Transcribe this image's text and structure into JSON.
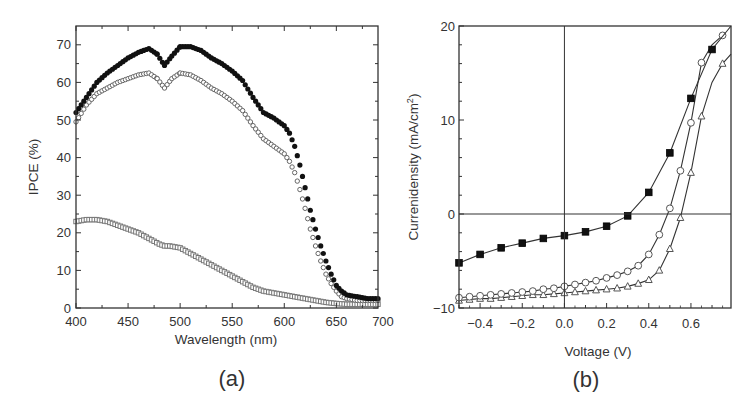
{
  "chart_data": [
    {
      "panel": "a",
      "type": "scatter",
      "caption": "(a)",
      "title": "",
      "xlabel": "Wavelength (nm)",
      "ylabel": "IPCE (%)",
      "xlim": [
        400,
        690
      ],
      "ylim": [
        0,
        75
      ],
      "xticks": [
        400,
        450,
        500,
        550,
        600,
        650,
        700
      ],
      "yticks": [
        0,
        10,
        20,
        30,
        40,
        50,
        60,
        70
      ],
      "grid": false,
      "legend": null,
      "series": [
        {
          "name": "filled circles",
          "marker": "filled-circle",
          "color": "#111111",
          "x": [
            400,
            410,
            420,
            430,
            440,
            450,
            460,
            470,
            478,
            485,
            492,
            500,
            510,
            520,
            530,
            540,
            550,
            560,
            570,
            580,
            590,
            600,
            605,
            610,
            615,
            620,
            625,
            630,
            635,
            640,
            645,
            650,
            655,
            660,
            670,
            680,
            690
          ],
          "y": [
            52,
            56,
            60,
            62.5,
            64.5,
            66.5,
            68,
            69,
            67.5,
            64.5,
            67,
            69.5,
            69.5,
            68.5,
            66.5,
            65,
            63,
            60.5,
            56,
            52,
            50.5,
            48.5,
            46.5,
            43,
            38,
            32,
            26,
            21,
            16.5,
            12.5,
            9,
            6,
            4.5,
            3.5,
            3,
            2.5,
            2.5
          ]
        },
        {
          "name": "open circles",
          "marker": "open-circle",
          "color": "#666666",
          "x": [
            400,
            410,
            420,
            430,
            440,
            450,
            460,
            470,
            478,
            485,
            492,
            500,
            510,
            520,
            530,
            540,
            550,
            560,
            570,
            580,
            590,
            600,
            605,
            610,
            615,
            620,
            625,
            630,
            635,
            640,
            645,
            650,
            655,
            660,
            670,
            680,
            690
          ],
          "y": [
            49.5,
            54,
            57,
            58.5,
            60,
            61,
            62,
            62.5,
            61,
            58.5,
            61,
            62.5,
            62,
            60.5,
            58.5,
            57,
            55,
            52.5,
            48.5,
            45,
            43,
            41,
            39,
            36,
            31.5,
            26.5,
            21,
            16.5,
            12.5,
            9,
            6.5,
            4.5,
            3,
            2.5,
            2,
            2,
            2
          ]
        },
        {
          "name": "open squares",
          "marker": "open-square",
          "color": "#777777",
          "x": [
            400,
            410,
            420,
            430,
            440,
            450,
            460,
            470,
            480,
            485,
            490,
            500,
            510,
            520,
            530,
            540,
            550,
            560,
            570,
            580,
            590,
            600,
            610,
            620,
            630,
            640,
            650,
            660,
            670,
            680,
            690
          ],
          "y": [
            23,
            23.5,
            23.5,
            23,
            22,
            21,
            20,
            18.5,
            17,
            16.5,
            16.5,
            16,
            14.5,
            13,
            11.5,
            10,
            8.5,
            7,
            5.5,
            4.5,
            4,
            3.5,
            3,
            2.5,
            2,
            1.5,
            1.2,
            1,
            1,
            1,
            1
          ]
        }
      ]
    },
    {
      "panel": "b",
      "type": "line",
      "caption": "(b)",
      "title": "",
      "xlabel": "Voltage (V)",
      "ylabel": "Currenidensity (mA/cm",
      "ylabel_superscript": "2",
      "ylabel_suffix": ")",
      "xlim": [
        -0.5,
        0.79
      ],
      "ylim": [
        -10,
        20
      ],
      "xticks": [
        -0.4,
        -0.2,
        0.0,
        0.2,
        0.4,
        0.6
      ],
      "yticks": [
        -10,
        0,
        10,
        20
      ],
      "grid": false,
      "reference_lines": {
        "x": 0,
        "y": 0
      },
      "legend": null,
      "series": [
        {
          "name": "filled squares",
          "marker": "filled-square",
          "color": "#111111",
          "x": [
            -0.5,
            -0.4,
            -0.3,
            -0.2,
            -0.1,
            0.0,
            0.1,
            0.2,
            0.3,
            0.4,
            0.5,
            0.6,
            0.7,
            0.79
          ],
          "y": [
            -5.2,
            -4.3,
            -3.6,
            -3.1,
            -2.6,
            -2.3,
            -1.9,
            -1.3,
            -0.2,
            2.3,
            6.5,
            12.3,
            17.5,
            20
          ]
        },
        {
          "name": "open circles",
          "marker": "open-circle",
          "color": "#555555",
          "x": [
            -0.5,
            -0.45,
            -0.4,
            -0.35,
            -0.3,
            -0.25,
            -0.2,
            -0.15,
            -0.1,
            -0.05,
            0.0,
            0.05,
            0.1,
            0.15,
            0.2,
            0.25,
            0.3,
            0.35,
            0.4,
            0.45,
            0.5,
            0.55,
            0.6,
            0.65,
            0.7,
            0.75
          ],
          "y": [
            -8.9,
            -8.8,
            -8.7,
            -8.6,
            -8.5,
            -8.4,
            -8.3,
            -8.2,
            -8.0,
            -7.9,
            -7.7,
            -7.5,
            -7.3,
            -7.1,
            -6.8,
            -6.5,
            -6.1,
            -5.5,
            -4.3,
            -2.2,
            0.6,
            4.6,
            9.7,
            16.1,
            18,
            19
          ]
        },
        {
          "name": "open triangles",
          "marker": "open-triangle",
          "color": "#555555",
          "x": [
            -0.5,
            -0.45,
            -0.4,
            -0.35,
            -0.3,
            -0.25,
            -0.2,
            -0.15,
            -0.1,
            -0.05,
            0.0,
            0.05,
            0.1,
            0.15,
            0.2,
            0.25,
            0.3,
            0.35,
            0.4,
            0.45,
            0.5,
            0.55,
            0.6,
            0.65,
            0.7,
            0.75,
            0.79
          ],
          "y": [
            -9.2,
            -9.1,
            -9.0,
            -9.0,
            -8.9,
            -8.8,
            -8.7,
            -8.6,
            -8.6,
            -8.5,
            -8.4,
            -8.3,
            -8.2,
            -8.1,
            -8.0,
            -7.9,
            -7.7,
            -7.4,
            -7.0,
            -6.0,
            -3.7,
            -0.4,
            4.4,
            10.4,
            14,
            16,
            17
          ]
        }
      ]
    }
  ],
  "panels": {
    "a": {
      "caption": "(a)",
      "xlabel": "Wavelength (nm)",
      "ylabel": "IPCE (%)"
    },
    "b": {
      "caption": "(b)",
      "xlabel": "Voltage (V)",
      "ylabel_main": "Currenidensity (mA/cm",
      "ylabel_sup": "2",
      "ylabel_end": ")"
    }
  }
}
